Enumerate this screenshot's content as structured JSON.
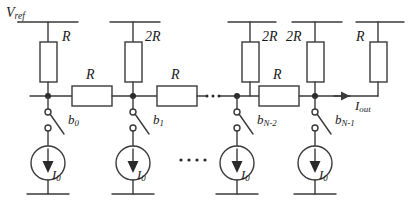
{
  "figure": {
    "type": "circuit-schematic",
    "name": "R-2R ladder current-steering DAC",
    "background": "#ffffff",
    "line_color": "#3a3a3a",
    "text_color": "#1a1a1a"
  },
  "labels": {
    "vref": "V",
    "vref_sub": "ref",
    "iout": "I",
    "iout_sub": "out"
  },
  "vertical_resistors": [
    {
      "id": "rv0",
      "label": "R",
      "x": 48,
      "label_side": "right"
    },
    {
      "id": "rv1",
      "label": "2R",
      "x": 133,
      "label_side": "right"
    },
    {
      "id": "rv2",
      "label": "2R",
      "x": 250,
      "label_side": "right"
    },
    {
      "id": "rv3",
      "label": "2R",
      "x": 315,
      "label_side": "left"
    },
    {
      "id": "rv4",
      "label": "R",
      "x": 378,
      "label_side": "left"
    }
  ],
  "series_resistors": [
    {
      "id": "rs0",
      "label": "R",
      "x": 90
    },
    {
      "id": "rs1",
      "label": "R",
      "x": 175
    },
    {
      "id": "rs2",
      "label": "R",
      "x": 278
    }
  ],
  "switches": [
    {
      "id": "sw0",
      "label": "b",
      "sub": "0",
      "x": 48
    },
    {
      "id": "sw1",
      "label": "b",
      "sub": "1",
      "x": 133
    },
    {
      "id": "sw2",
      "label": "b",
      "sub": "N-2",
      "x": 237
    },
    {
      "id": "sw3",
      "label": "b",
      "sub": "N-1",
      "x": 315
    }
  ],
  "current_sources": [
    {
      "id": "is0",
      "label": "I",
      "sub": "0",
      "x": 48
    },
    {
      "id": "is1",
      "label": "I",
      "sub": "0",
      "x": 133
    },
    {
      "id": "is2",
      "label": "I",
      "sub": "0",
      "x": 237
    },
    {
      "id": "is3",
      "label": "I",
      "sub": "0",
      "x": 315
    }
  ],
  "ellipses": [
    {
      "id": "ellipsis-rail",
      "x": 212,
      "y": 96,
      "dots": 3
    },
    {
      "id": "ellipsis-sources",
      "x": 190,
      "y": 160,
      "dots": 4
    }
  ],
  "nodes": [
    48,
    133,
    237,
    315
  ]
}
